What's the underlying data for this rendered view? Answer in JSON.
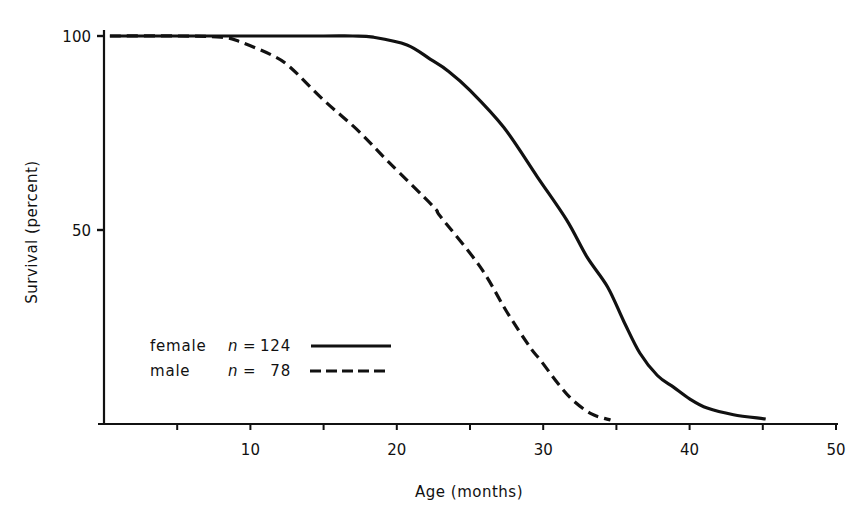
{
  "chart_data": {
    "type": "line",
    "title": "",
    "xlabel": "Age (months)",
    "ylabel": "Survival (percent)",
    "xlim": [
      0,
      50
    ],
    "ylim": [
      0,
      100
    ],
    "x_ticks": [
      5,
      10,
      15,
      20,
      25,
      30,
      35,
      40,
      45,
      50
    ],
    "x_tick_labels": [
      {
        "value": 10,
        "label": "10"
      },
      {
        "value": 20,
        "label": "20"
      },
      {
        "value": 30,
        "label": "30"
      },
      {
        "value": 40,
        "label": "40"
      },
      {
        "value": 50,
        "label": "50"
      }
    ],
    "y_ticks": [
      {
        "value": 100,
        "label": "100"
      },
      {
        "value": 50,
        "label": "50"
      }
    ],
    "grid": false,
    "legend_position": "lower-left inside plot",
    "series": [
      {
        "name": "female",
        "n_label": "n =",
        "n_value": "124",
        "style": "solid",
        "color": "#111111",
        "points": [
          [
            0.4,
            100
          ],
          [
            5,
            100
          ],
          [
            10,
            100
          ],
          [
            15,
            100
          ],
          [
            17,
            100
          ],
          [
            18.4,
            99.7
          ],
          [
            20.7,
            97.7
          ],
          [
            22.3,
            94
          ],
          [
            23.5,
            91
          ],
          [
            25,
            86
          ],
          [
            27.3,
            76.5
          ],
          [
            29.6,
            63.7
          ],
          [
            31.6,
            52.6
          ],
          [
            33,
            43
          ],
          [
            34.4,
            35.3
          ],
          [
            35.5,
            26.5
          ],
          [
            36.6,
            18.3
          ],
          [
            37.8,
            12.5
          ],
          [
            38.9,
            9.5
          ],
          [
            40,
            6.5
          ],
          [
            41.2,
            4.1
          ],
          [
            43,
            2.4
          ],
          [
            45.2,
            1.3
          ]
        ]
      },
      {
        "name": "male",
        "n_label": "n =",
        "n_value": "78",
        "style": "dashed",
        "color": "#111111",
        "points": [
          [
            0.4,
            100
          ],
          [
            5,
            100
          ],
          [
            8,
            99.7
          ],
          [
            9.3,
            98.5
          ],
          [
            11.5,
            95
          ],
          [
            12.7,
            92
          ],
          [
            15,
            83.5
          ],
          [
            17.3,
            75.8
          ],
          [
            19.5,
            67.3
          ],
          [
            22.5,
            56
          ],
          [
            23,
            53.4
          ],
          [
            25.7,
            40.5
          ],
          [
            27.5,
            29
          ],
          [
            29.1,
            19.8
          ],
          [
            29.8,
            16.5
          ],
          [
            31,
            10.5
          ],
          [
            32,
            6.2
          ],
          [
            33.3,
            2.6
          ],
          [
            34.6,
            1
          ]
        ]
      }
    ]
  },
  "legend": {
    "items": [
      {
        "label": "female",
        "n_symbol": "n",
        "eq": "=",
        "count": "124"
      },
      {
        "label": "male",
        "n_symbol": "n",
        "eq": "=",
        "count": "78"
      }
    ]
  }
}
